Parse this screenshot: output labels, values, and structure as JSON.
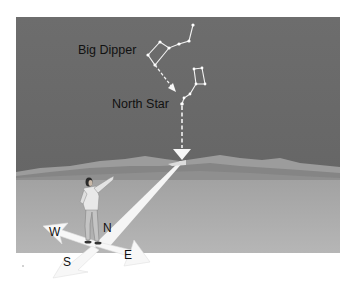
{
  "figure": {
    "labels": {
      "big_dipper": "Big Dipper",
      "north_star": "North Star"
    },
    "compass": {
      "north": "N",
      "south": "S",
      "east": "E",
      "west": "W"
    },
    "colors": {
      "sky": "#6a6a6a",
      "ground": "#ababab",
      "hills_light": "#9a9a9a",
      "hills_dark": "#7e7e7e",
      "stars_lines": "#f2f2f2",
      "arrows": "#f7f7f7",
      "text": "#111111",
      "background": "#ffffff"
    }
  }
}
